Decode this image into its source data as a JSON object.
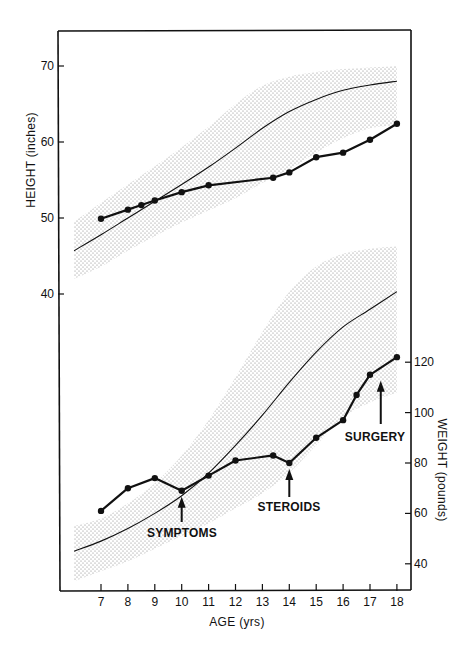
{
  "chart_data": {
    "type": "line",
    "title": "",
    "xlabel": "AGE (yrs)",
    "x_ticks": [
      7,
      8,
      9,
      10,
      11,
      12,
      13,
      14,
      15,
      16,
      17,
      18
    ],
    "xlim": [
      5.6,
      18.5
    ],
    "grid": false,
    "panels": [
      {
        "name": "height",
        "ylabel": "HEIGHT (inches)",
        "y_axis_side": "left",
        "y_ticks": [
          40,
          50,
          60,
          70
        ],
        "series": [
          {
            "name": "Patient height",
            "style": "thick line with filled circle markers",
            "x": [
              7,
              8,
              8.5,
              9,
              10,
              11,
              13.4,
              14,
              15,
              16,
              17,
              18
            ],
            "y": [
              49.9,
              51.1,
              51.7,
              52.3,
              53.4,
              54.3,
              55.3,
              56.0,
              58.0,
              58.6,
              60.3,
              62.4
            ]
          },
          {
            "name": "Normal mean height (50th percentile)",
            "style": "thin line",
            "x": [
              6,
              7,
              8,
              9,
              10,
              11,
              12,
              13,
              14,
              15,
              16,
              17,
              18
            ],
            "y": [
              45.7,
              47.8,
              50.0,
              52.2,
              54.4,
              56.7,
              59.2,
              61.8,
              64.0,
              65.6,
              66.8,
              67.5,
              68.0
            ]
          },
          {
            "name": "Normal range (shaded band)",
            "style": "stippled band",
            "x": [
              6,
              7,
              8,
              9,
              10,
              11,
              12,
              13,
              14,
              15,
              16,
              17,
              18
            ],
            "upper": [
              49.5,
              52.0,
              54.4,
              56.8,
              59.3,
              62.0,
              65.0,
              67.4,
              68.6,
              69.2,
              69.6,
              69.8,
              70.0
            ],
            "lower": [
              42.0,
              43.6,
              45.7,
              47.6,
              49.4,
              51.0,
              52.6,
              54.6,
              56.4,
              58.6,
              60.5,
              61.8,
              62.2
            ]
          }
        ]
      },
      {
        "name": "weight",
        "ylabel": "WEIGHT (pounds)",
        "y_axis_side": "right",
        "y_ticks": [
          40,
          60,
          80,
          100,
          120
        ],
        "series": [
          {
            "name": "Patient weight",
            "style": "thick line with filled circle markers",
            "x": [
              7,
              8,
              9,
              10,
              11,
              12,
              13.4,
              14,
              15,
              16,
              16.5,
              17,
              18
            ],
            "y": [
              61,
              70,
              74,
              69,
              75,
              81,
              83,
              80,
              90,
              97,
              107,
              115,
              122
            ]
          },
          {
            "name": "Normal mean weight (50th percentile)",
            "style": "thin line",
            "x": [
              6,
              7,
              8,
              9,
              10,
              11,
              12,
              13,
              14,
              15,
              16,
              17,
              18
            ],
            "y": [
              45,
              49,
              54,
              60,
              67,
              76,
              87,
              99,
              112,
              124,
              134,
              141,
              148
            ]
          },
          {
            "name": "Normal range (shaded band)",
            "style": "stippled band",
            "x": [
              6,
              7,
              8,
              9,
              10,
              11,
              12,
              13,
              14,
              15,
              16,
              17,
              18
            ],
            "upper": [
              55,
              58,
              64,
              72,
              83,
              97,
              114,
              132,
              148,
              158,
              163,
              165,
              166
            ],
            "lower": [
              33,
              37,
              41,
              46,
              51,
              56,
              62,
              68,
              76,
              87,
              98,
              104,
              108
            ]
          }
        ]
      }
    ],
    "annotations": [
      {
        "text": "SYMPTOMS",
        "arrow_x": 10,
        "panel": "weight",
        "arrow_to_y": 69
      },
      {
        "text": "STEROIDS",
        "arrow_x": 14,
        "panel": "weight",
        "arrow_to_y": 80
      },
      {
        "text": "SURGERY",
        "arrow_x": 17.4,
        "panel": "weight",
        "arrow_to_y": 115
      }
    ]
  },
  "labels": {
    "height_axis_title": "HEIGHT (inches)",
    "weight_axis_title": "WEIGHT (pounds)",
    "x_axis_title": "AGE (yrs)",
    "symptoms": "SYMPTOMS",
    "steroids": "STEROIDS",
    "surgery": "SURGERY"
  },
  "colors": {
    "ink": "#111111",
    "stipple": "#8a8a8a",
    "background": "#ffffff"
  }
}
